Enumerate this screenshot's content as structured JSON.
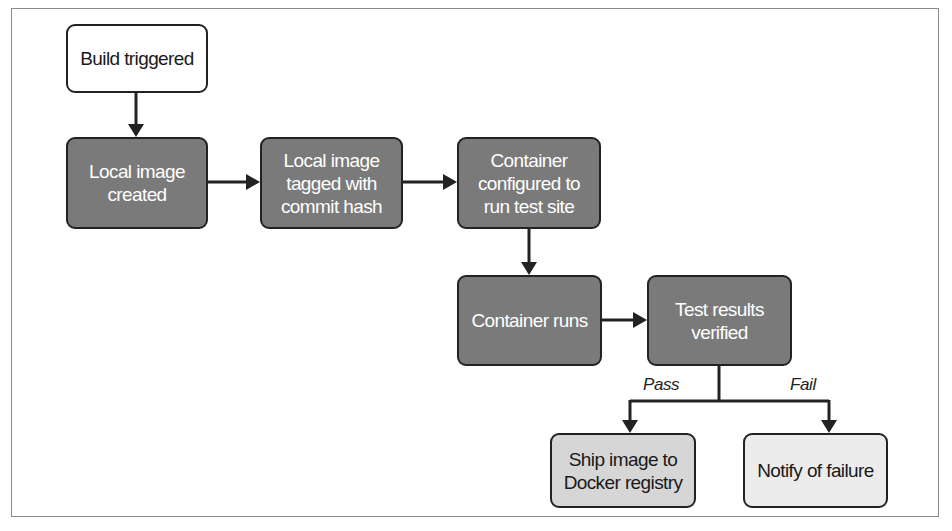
{
  "diagram": {
    "nodes": [
      {
        "id": "build-triggered",
        "label": "Build triggered",
        "style": "white"
      },
      {
        "id": "local-image-created",
        "label": "Local image created",
        "style": "dark"
      },
      {
        "id": "local-image-tagged",
        "label": "Local image tagged with commit hash",
        "style": "dark"
      },
      {
        "id": "container-configured",
        "label": "Container configured to run test site",
        "style": "dark"
      },
      {
        "id": "container-runs",
        "label": "Container runs",
        "style": "dark"
      },
      {
        "id": "test-results-verified",
        "label": "Test results verified",
        "style": "dark"
      },
      {
        "id": "ship-image",
        "label": "Ship image to Docker registry",
        "style": "light"
      },
      {
        "id": "notify-failure",
        "label": "Notify of failure",
        "style": "lighter"
      }
    ],
    "edges": [
      {
        "from": "build-triggered",
        "to": "local-image-created"
      },
      {
        "from": "local-image-created",
        "to": "local-image-tagged"
      },
      {
        "from": "local-image-tagged",
        "to": "container-configured"
      },
      {
        "from": "container-configured",
        "to": "container-runs"
      },
      {
        "from": "container-runs",
        "to": "test-results-verified"
      },
      {
        "from": "test-results-verified",
        "to": "ship-image",
        "label": "Pass"
      },
      {
        "from": "test-results-verified",
        "to": "notify-failure",
        "label": "Fail"
      }
    ],
    "edge_labels": {
      "pass": "Pass",
      "fail": "Fail"
    },
    "colors": {
      "dark_fill": "#7a7a7a",
      "light_fill": "#d6d6d6",
      "lighter_fill": "#ececec",
      "stroke": "#222222"
    }
  }
}
